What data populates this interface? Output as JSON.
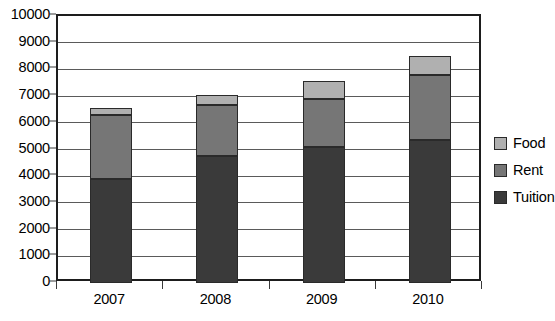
{
  "chart_data": {
    "type": "bar",
    "subtype": "stacked-bar",
    "title": "",
    "subtitle": "",
    "xlabel": "",
    "ylabel": "",
    "categories": [
      "2007",
      "2008",
      "2009",
      "2010"
    ],
    "series": [
      {
        "name": "Tuition",
        "values": [
          3900,
          4750,
          5100,
          5350
        ],
        "color": "#3a3a3a"
      },
      {
        "name": "Rent",
        "values": [
          2400,
          1900,
          1800,
          2450
        ],
        "color": "#767676"
      },
      {
        "name": "Food",
        "values": [
          250,
          400,
          650,
          700
        ],
        "color": "#b0b0b0"
      }
    ],
    "totals": [
      6550,
      7050,
      7550,
      8500
    ],
    "ylim": [
      0,
      10000
    ],
    "ytick_values": [
      0,
      1000,
      2000,
      3000,
      4000,
      5000,
      6000,
      7000,
      8000,
      9000,
      10000
    ],
    "ytick_labels": [
      "0",
      "1000",
      "2000",
      "3000",
      "4000",
      "5000",
      "6000",
      "7000",
      "8000",
      "9000",
      "10000"
    ],
    "grid": true,
    "grid_axis": "y",
    "legend_position": "right",
    "legend_entries": [
      "Food",
      "Rent",
      "Tuition"
    ],
    "stack_order_bottom_to_top": [
      "Tuition",
      "Rent",
      "Food"
    ],
    "annotations": []
  },
  "colors": {
    "food": "#b0b0b0",
    "rent": "#767676",
    "tuition": "#3a3a3a",
    "axis": "#1d1d1d",
    "grid": "#5a5a5a",
    "background": "#ffffff",
    "text": "#000000"
  }
}
